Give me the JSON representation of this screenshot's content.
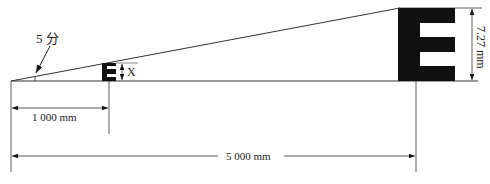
{
  "diagram": {
    "angle_label": "5 分",
    "small_optotype": {
      "symbol": "E",
      "height_label": "X"
    },
    "large_optotype": {
      "symbol": "E",
      "height_label": "7.27 mm"
    },
    "near_distance_label": "1 000 mm",
    "far_distance_label": "5 000 mm",
    "colors": {
      "ink": "#111111",
      "background": "#ffffff"
    }
  }
}
